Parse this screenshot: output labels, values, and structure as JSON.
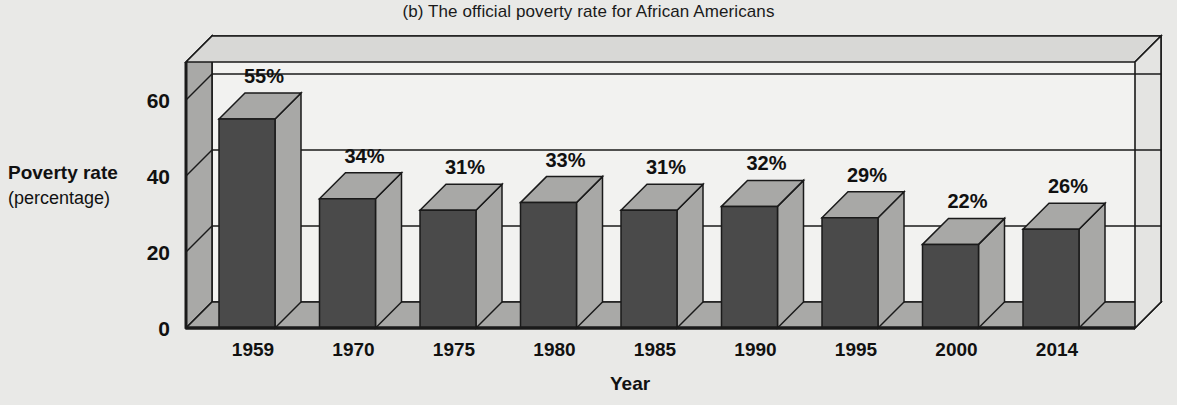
{
  "chart_data": {
    "type": "bar",
    "title": "(b) The official poverty rate for African Americans",
    "xlabel": "Year",
    "ylabel": "Poverty rate",
    "ylabel_sub": "(percentage)",
    "categories": [
      "1959",
      "1970",
      "1975",
      "1980",
      "1985",
      "1990",
      "1995",
      "2000",
      "2014"
    ],
    "values": [
      55,
      34,
      31,
      33,
      31,
      32,
      29,
      22,
      26
    ],
    "value_labels": [
      "55%",
      "34%",
      "31%",
      "33%",
      "31%",
      "32%",
      "29%",
      "22%",
      "26%"
    ],
    "ylim": [
      0,
      70
    ],
    "yticks": [
      0,
      20,
      40,
      60
    ],
    "ytick_labels": [
      "0",
      "20",
      "40",
      "60"
    ],
    "grid": true,
    "legend": "none",
    "style": "3d-bar",
    "colors": {
      "page_background": "#e9e9e7",
      "plot_back_wall": "#f2f2f0",
      "plot_side_wall": "#a9a9a7",
      "plot_floor": "#a9a9a7",
      "bar_front": "#4a4a4a",
      "bar_top": "#a8a8a6",
      "bar_side": "#a8a8a6",
      "outline": "#1a1a1a",
      "text": "#111111"
    }
  }
}
